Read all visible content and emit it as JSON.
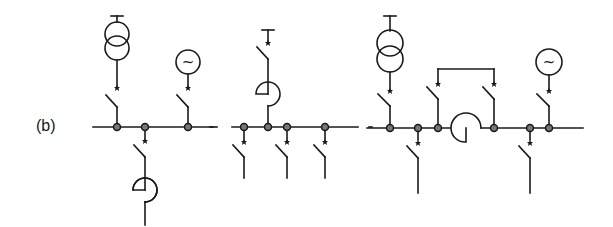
{
  "figure": {
    "label": "(b)",
    "colors": {
      "line": "#1a1a1a",
      "node_fill": "#777777",
      "background": "#ffffff"
    }
  },
  "diagrams": [
    {
      "id": "left",
      "busbar": {
        "x1": 93,
        "x2": 213,
        "y": 127
      },
      "nodes_x": [
        117,
        145,
        188
      ],
      "components": [
        {
          "type": "transformer-icon",
          "x": 117,
          "connects": "above-bus"
        },
        {
          "type": "generator-icon",
          "x": 188,
          "symbol": "~",
          "connects": "above-bus"
        },
        {
          "type": "feeder-with-reactor",
          "x": 145,
          "connects": "below-bus"
        }
      ]
    },
    {
      "id": "middle",
      "busbar": {
        "x1": 232,
        "x2": 358,
        "y": 127
      },
      "nodes_x": [
        244,
        268,
        287,
        325
      ],
      "components": [
        {
          "type": "incoming-with-reactor",
          "x": 268,
          "connects": "above-bus"
        },
        {
          "type": "feeder",
          "x": 244,
          "connects": "below-bus"
        },
        {
          "type": "feeder",
          "x": 287,
          "connects": "below-bus"
        },
        {
          "type": "feeder",
          "x": 325,
          "connects": "below-bus"
        }
      ]
    },
    {
      "id": "right",
      "busbar": {
        "x1": 367,
        "x2": 583,
        "y": 128
      },
      "nodes_x": [
        390,
        418,
        438,
        494,
        530,
        549
      ],
      "components": [
        {
          "type": "transformer-icon",
          "x": 390,
          "connects": "above-bus"
        },
        {
          "type": "generator-icon",
          "x": 549,
          "symbol": "~",
          "connects": "above-bus"
        },
        {
          "type": "bus-reactor",
          "x1": 438,
          "x2": 494
        },
        {
          "type": "bypass-breakers",
          "x1": 438,
          "x2": 494,
          "y": 70
        },
        {
          "type": "feeder",
          "x": 418,
          "connects": "below-bus"
        },
        {
          "type": "feeder",
          "x": 530,
          "connects": "below-bus"
        }
      ]
    }
  ],
  "glyphs": {
    "generator": "~"
  }
}
